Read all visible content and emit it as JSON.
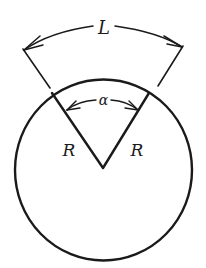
{
  "diagram": {
    "labels": {
      "arc_length": "L",
      "angle": "α",
      "radius_left": "R",
      "radius_right": "R"
    },
    "colors": {
      "stroke": "#1a1a1a",
      "background": "#ffffff"
    },
    "geometry": {
      "circle_center": [
        103,
        170
      ],
      "circle_radius": 90,
      "sector_vertex": [
        103,
        168
      ],
      "sector_left_point": [
        52,
        93
      ],
      "sector_right_point": [
        149,
        93
      ]
    }
  }
}
